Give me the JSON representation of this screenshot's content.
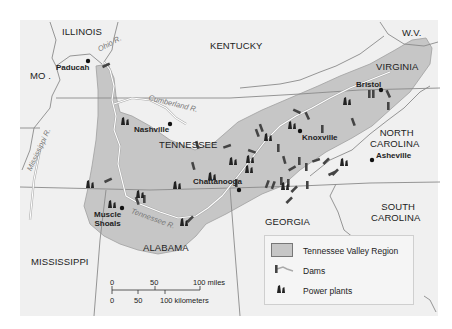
{
  "map": {
    "colors": {
      "background": "#ffffff",
      "panel": "#f0f0f0",
      "region_fill": "#c6c6c6",
      "region_edge": "#9a9a9a",
      "state_border": "#8a8a8a",
      "river": "#ffffff",
      "symbol": "#222222"
    },
    "states": {
      "illinois": "ILLINOIS",
      "kentucky": "KENTUCKY",
      "wv": "W.V.",
      "virginia": "VIRGINIA",
      "mo": "MO .",
      "tennessee": "TENNESSEE",
      "north_carolina_1": "NORTH",
      "north_carolina_2": "CAROLINA",
      "south_carolina_1": "SOUTH",
      "south_carolina_2": "CAROLINA",
      "georgia": "GEORGIA",
      "alabama": "ALABAMA",
      "mississippi": "MISSISSIPPI"
    },
    "cities": {
      "paducah": "Paducah",
      "nashville": "Nashville",
      "bristol": "Bristol",
      "knoxville": "Knoxville",
      "asheville": "Asheville",
      "chattanooga": "Chattanooga",
      "muscle_shoals_1": "Muscle",
      "muscle_shoals_2": "Shoals"
    },
    "rivers": {
      "ohio": "Ohio R.",
      "cumberland": "Cumberland R.",
      "mississippi": "Mississippi R.",
      "tennessee": "Tennessee R."
    }
  },
  "legend": {
    "items": [
      {
        "icon": "region-swatch",
        "label": "Tennessee Valley Region"
      },
      {
        "icon": "dam-icon",
        "label": "Dams"
      },
      {
        "icon": "power-plant-icon",
        "label": "Power plants"
      }
    ]
  },
  "scale": {
    "miles_ticks": [
      "0",
      "50",
      "100 miles"
    ],
    "km_ticks": [
      "0",
      "50",
      "100 kilometers"
    ]
  }
}
